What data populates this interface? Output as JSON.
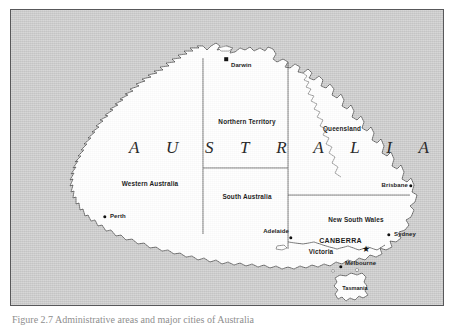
{
  "figure": {
    "caption": "Figure 2.7  Administrative areas and major cities of Australia"
  },
  "map": {
    "title_letters": [
      "A",
      "U",
      "S",
      "T",
      "R",
      "A",
      "L",
      "I",
      "A"
    ],
    "ocean_color": "#c9c9c9",
    "land_color": "#ffffff",
    "border_color": "#58585a",
    "states": [
      {
        "name": "Northern Territory",
        "x": 236,
        "y": 111
      },
      {
        "name": "Queensland",
        "x": 331,
        "y": 118
      },
      {
        "name": "Western Australia",
        "x": 139,
        "y": 173
      },
      {
        "name": "South Australia",
        "x": 236,
        "y": 186
      },
      {
        "name": "New South Wales",
        "x": 345,
        "y": 209
      },
      {
        "name": "Victoria",
        "x": 310,
        "y": 241
      },
      {
        "name": "Tasmania",
        "x": 344,
        "y": 287
      }
    ],
    "cities": [
      {
        "name": "Darwin",
        "marker": "square",
        "mx": 215,
        "my": 49,
        "lx": 220,
        "ly": 55,
        "anchor": "left",
        "capital": false
      },
      {
        "name": "Perth",
        "marker": "dot",
        "mx": 94,
        "my": 207,
        "lx": 99,
        "ly": 203,
        "anchor": "left",
        "capital": false
      },
      {
        "name": "Brisbane",
        "marker": "dot",
        "mx": 400,
        "my": 176,
        "lx": 397,
        "ly": 172,
        "anchor": "right",
        "capital": false
      },
      {
        "name": "Adelaide",
        "marker": "dot",
        "mx": 280,
        "my": 228,
        "lx": 277,
        "ly": 221,
        "anchor": "right",
        "capital": false
      },
      {
        "name": "Sydney",
        "marker": "dot",
        "mx": 378,
        "my": 225,
        "lx": 383,
        "ly": 224,
        "anchor": "left",
        "capital": false
      },
      {
        "name": "Melbourne",
        "marker": "dot",
        "mx": 330,
        "my": 257,
        "lx": 334,
        "ly": 253,
        "anchor": "left",
        "capital": false
      },
      {
        "name": "CANBERRA",
        "marker": "star",
        "mx": 355,
        "my": 238,
        "lx": 350,
        "ly": 232,
        "anchor": "right",
        "capital": true
      }
    ]
  }
}
